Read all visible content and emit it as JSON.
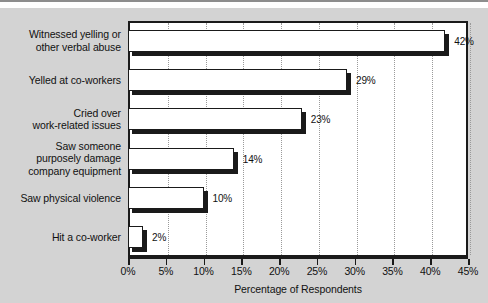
{
  "chart_data": {
    "type": "bar",
    "orientation": "horizontal",
    "title": "",
    "xlabel": "Percentage of Respondents",
    "ylabel": "",
    "xlim": [
      0,
      45
    ],
    "grid": true,
    "legend": null,
    "xticks": [
      "0%",
      "5%",
      "10%",
      "15%",
      "20%",
      "25%",
      "30%",
      "35%",
      "40%",
      "45%"
    ],
    "xtick_values": [
      0,
      5,
      10,
      15,
      20,
      25,
      30,
      35,
      40,
      45
    ],
    "categories": [
      "Witnessed yelling or other verbal abuse",
      "Yelled at co-workers",
      "Cried over work-related issues",
      "Saw someone purposely damage company equipment",
      "Saw physical violence",
      "Hit a co-worker"
    ],
    "category_lines": [
      [
        "Witnessed yelling or",
        "other verbal abuse"
      ],
      [
        "Yelled at co-workers"
      ],
      [
        "Cried over",
        "work-related issues"
      ],
      [
        "Saw someone",
        "purposely damage",
        "company equipment"
      ],
      [
        "Saw physical violence"
      ],
      [
        "Hit a co-worker"
      ]
    ],
    "values": [
      42,
      29,
      23,
      14,
      10,
      2
    ],
    "value_labels": [
      "42%",
      "29%",
      "23%",
      "14%",
      "10%",
      "2%"
    ],
    "colors": {
      "background": "#d3d3d3",
      "plot_background": "#ffffff",
      "bar_fill": "#ffffff",
      "bar_edge": "#1a1a1a",
      "bar_shadow": "#1a1a1a",
      "gridline": "#9a9a9a",
      "text": "#111111"
    }
  }
}
